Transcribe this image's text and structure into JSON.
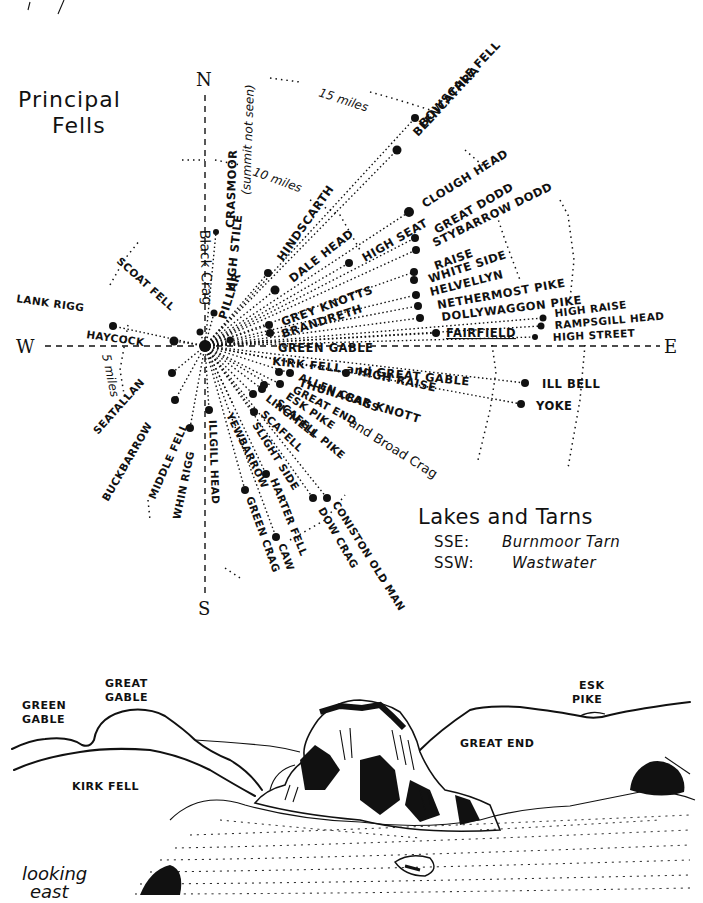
{
  "diagram": {
    "title_line1": "Principal",
    "title_line2": "Fells",
    "compass": {
      "north": "N",
      "south": "S",
      "east": "E",
      "west": "W"
    },
    "distance_rings": {
      "inner": "5 miles",
      "middle": "10 miles",
      "outer": "15 miles"
    },
    "fells": {
      "north_sector": [
        {
          "name": "BOWSCALE FELL"
        },
        {
          "name": "BLENCATHRA"
        },
        {
          "name": "CRASMOOR (summit not seen)"
        },
        {
          "name": "HIGH STILE"
        },
        {
          "name": "Black Crag"
        },
        {
          "name": "PILLAR"
        },
        {
          "name": "HINDSCARTH"
        },
        {
          "name": "DALE HEAD"
        },
        {
          "name": "HIGH SEAT"
        },
        {
          "name": "CLOUGH HEAD"
        }
      ],
      "east_sector": [
        {
          "name": "GREAT DODD"
        },
        {
          "name": "STYBARROW DODD"
        },
        {
          "name": "RAISE"
        },
        {
          "name": "WHITE SIDE"
        },
        {
          "name": "HELVELLYN"
        },
        {
          "name": "NETHERMOST PIKE"
        },
        {
          "name": "DOLLYWAGGON PIKE"
        },
        {
          "name": "HIGH RAISE"
        },
        {
          "name": "RAMPSGILL HEAD"
        },
        {
          "name": "HIGH STREET"
        },
        {
          "name": "FAIRFIELD"
        },
        {
          "name": "GREY KNOTTS"
        },
        {
          "name": "BRANDRETH"
        },
        {
          "name": "GREEN GABLE"
        },
        {
          "name": "KIRK FELL and GREAT GABLE"
        },
        {
          "name": "HIGH RAISE (2)"
        },
        {
          "name": "ILL BELL"
        },
        {
          "name": "YOKE"
        },
        {
          "name": "THUNACAR KNOTT"
        },
        {
          "name": "ALLEN CRAGS"
        },
        {
          "name": "GREAT END"
        },
        {
          "name": "ESK PIKE"
        },
        {
          "name": "LINGMELL"
        },
        {
          "name": "SCAFELL PIKE and Broad Crag"
        },
        {
          "name": "SCAFELL"
        }
      ],
      "south_sector": [
        {
          "name": "SLIGHT SIDE"
        },
        {
          "name": "YEWBARROW"
        },
        {
          "name": "ILLGILL HEAD"
        },
        {
          "name": "HARTER FELL"
        },
        {
          "name": "GREEN CRAG"
        },
        {
          "name": "CAW"
        },
        {
          "name": "CONISTON OLD MAN"
        },
        {
          "name": "DOW CRAG"
        },
        {
          "name": "WHIN RIGG"
        }
      ],
      "west_sector": [
        {
          "name": "MIDDLE FELL"
        },
        {
          "name": "BUCKBARROW"
        },
        {
          "name": "SEATALLAN"
        },
        {
          "name": "HAYCOCK"
        },
        {
          "name": "LANK RIGG"
        },
        {
          "name": "SCOAT FELL"
        }
      ]
    },
    "labels": {
      "bowscale": "BOWSCALE FELL",
      "blencathra": "BLENCATHRA",
      "crasmoor": "CRASMOOR",
      "crasmoor_note": "(summit not seen)",
      "high_stile": "HIGH STILE",
      "black_crag": "Black Crag",
      "pillar": "PILLAR",
      "hindscarth": "HINDSCARTH",
      "dale_head": "DALE HEAD",
      "high_seat": "HIGH SEAT",
      "clough_head": "CLOUGH HEAD",
      "great_dodd": "GREAT DODD",
      "stybarrow_dodd": "STYBARROW DODD",
      "raise": "RAISE",
      "white_side": "WHITE SIDE",
      "helvellyn": "HELVELLYN",
      "nethermost_pike": "NETHERMOST PIKE",
      "dollywaggon_pike": "DOLLYWAGGON PIKE",
      "high_raise_e": "HIGH RAISE",
      "rampsgill_head": "RAMPSGILL HEAD",
      "high_street": "HIGH STREET",
      "fairfield": "FAIRFIELD",
      "grey_knotts": "GREY KNOTTS",
      "brandreth": "BRANDRETH",
      "green_gable": "GREEN GABLE",
      "kirk_fell_great_gable": "KIRK FELL and GREAT GABLE",
      "high_raise_c": "HIGH RAISE",
      "ill_bell": "ILL BELL",
      "yoke": "YOKE",
      "thunacar_knott": "THUNACAR KNOTT",
      "allen_crags": "ALLEN CRAGS",
      "great_end": "GREAT END",
      "esk_pike": "ESK PIKE",
      "lingmell": "LINGMELL",
      "scafell_pike": "SCAFELL PIKE",
      "broad_crag": "and Broad Crag",
      "scafell": "SCAFELL",
      "slight_side": "SLIGHT SIDE",
      "yewbarrow": "YEWBARROW",
      "illgill_head": "ILLGILL HEAD",
      "harter_fell": "HARTER FELL",
      "green_crag": "GREEN CRAG",
      "caw": "CAW",
      "coniston_old_man": "CONISTON OLD MAN",
      "dow_crag": "DOW CRAG",
      "whin_rigg": "WHIN RIGG",
      "middle_fell": "MIDDLE FELL",
      "buckbarrow": "BUCKBARROW",
      "seatallan": "SEATALLAN",
      "haycock": "HAYCOCK",
      "lank_rigg": "LANK RIGG",
      "scoat_fell": "SCOAT FELL"
    },
    "lakes_and_tarns": {
      "title": "Lakes and Tarns",
      "entries": [
        {
          "direction": "SSE:",
          "name": "Burnmoor Tarn"
        },
        {
          "direction": "SSW:",
          "name": "Wastwater"
        }
      ]
    }
  },
  "sketch": {
    "caption_line1": "looking",
    "caption_line2": "east",
    "labels": {
      "green_gable_1": "GREEN",
      "green_gable_2": "GABLE",
      "great_gable_1": "GREAT",
      "great_gable_2": "GABLE",
      "kirk_fell": "KIRK FELL",
      "esk_pike_1": "ESK",
      "esk_pike_2": "PIKE",
      "great_end": "GREAT END"
    }
  },
  "colors": {
    "ink": "#111111",
    "paper": "#ffffff"
  }
}
